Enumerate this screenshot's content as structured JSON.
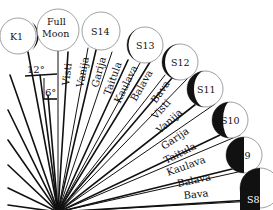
{
  "diagram": {
    "colors": {
      "ink": "#111111",
      "circle_stroke": "#888888",
      "background": "#ffffff"
    },
    "moons": [
      {
        "id": "K1",
        "label": "K1",
        "cx": 18,
        "cy": 36,
        "r": 18,
        "phase": "thin-crescent-right"
      },
      {
        "id": "FM",
        "label_line1": "Full",
        "label_line2": "Moon",
        "cx": 58,
        "cy": 30,
        "r": 21,
        "phase": "full"
      },
      {
        "id": "S14",
        "label": "S14",
        "cx": 101,
        "cy": 31,
        "r": 19,
        "phase": "full"
      },
      {
        "id": "S13",
        "label": "S13",
        "cx": 145,
        "cy": 45,
        "r": 18,
        "phase": "thin-crescent-left"
      },
      {
        "id": "S12",
        "label": "S12",
        "cx": 180,
        "cy": 62,
        "r": 18,
        "phase": "crescent-left"
      },
      {
        "id": "S11",
        "label": "S11",
        "cx": 205,
        "cy": 89,
        "r": 18,
        "phase": "crescent-left"
      },
      {
        "id": "S10",
        "label": "S10",
        "cx": 230,
        "cy": 120,
        "r": 18,
        "phase": "gibbous-left"
      },
      {
        "id": "S9",
        "label": "S9",
        "cx": 244,
        "cy": 155,
        "r": 18,
        "phase": "half-left"
      },
      {
        "id": "S8",
        "label": "S8",
        "cx": 260,
        "cy": 188,
        "r": 20,
        "phase": "half-dark"
      }
    ],
    "karanas": [
      "Visti",
      "Vanija",
      "Garija",
      "Taitula",
      "Kaulava",
      "Balava",
      "Bava",
      "Visti",
      "Vanija",
      "Garija",
      "Taitula",
      "Kaulava",
      "Balava",
      "Bava"
    ],
    "angle_markers": [
      {
        "label": "12°"
      },
      {
        "label": "6°"
      }
    ],
    "labels": {
      "k1": "K1",
      "full": "Full",
      "moon": "Moon",
      "s14": "S14",
      "s13": "S13",
      "s12": "S12",
      "s11": "S11",
      "s10": "S10",
      "s9": "S9",
      "s8": "S8",
      "deg12": "12°",
      "deg6": "6°",
      "k_visti1": "Visti",
      "k_vanija1": "Vanija",
      "k_garija1": "Garija",
      "k_taitula1": "Taitula",
      "k_kaulava1": "Kaulava",
      "k_balava1": "Balava",
      "k_bava1": "Bava",
      "k_visti2": "Visti",
      "k_vanija2": "Vanija",
      "k_garija2": "Garija",
      "k_taitula2": "Taitula",
      "k_kaulava2": "Kaulava",
      "k_balava2": "Balava",
      "k_bava2": "Bava"
    }
  }
}
